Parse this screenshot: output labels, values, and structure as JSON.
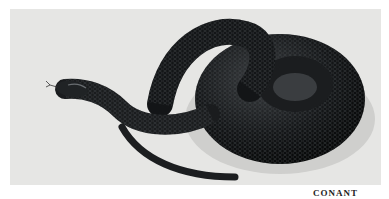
{
  "photo": {
    "subject": "coiled black snake with forked tongue extended",
    "background_color": "#e6e6e4",
    "snake_color": "#141618"
  },
  "caption": {
    "credit": "CONANT"
  }
}
